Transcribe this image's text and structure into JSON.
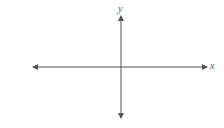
{
  "diagram": {
    "type": "cartesian-axes",
    "axes": {
      "x": {
        "label": "x",
        "bidirectional": true
      },
      "y": {
        "label": "y",
        "bidirectional": true
      }
    },
    "colors": {
      "axis": "#555555",
      "label": "#555555",
      "background": "#ffffff"
    }
  }
}
